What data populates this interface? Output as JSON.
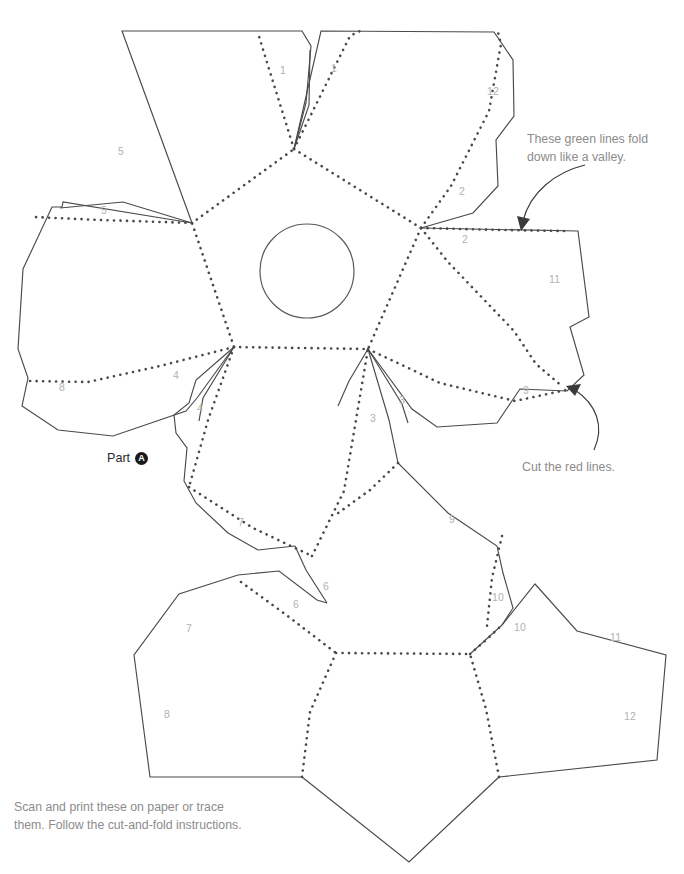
{
  "sheet": {
    "title": "Papercraft Dodecahedron Template",
    "part_label": "Part",
    "part_badge": "A",
    "caption": "Scan and print these on paper or trace\nthem. Follow the cut-and-fold instructions.",
    "background_color": "#ffffff",
    "cut_line_color": "#4a4a4a",
    "fold_line_color": "#4a4a4a",
    "number_color": "#b2b2b2",
    "annotation_color": "#8c8c8c"
  },
  "annotations": [
    {
      "id": "valley",
      "text": "These green lines fold\ndown like a valley."
    },
    {
      "id": "cut",
      "text": "Cut the red lines."
    }
  ],
  "tab_numbers": [
    {
      "label": "1",
      "x": 280,
      "y": 74
    },
    {
      "label": "1",
      "x": 331,
      "y": 72
    },
    {
      "label": "12",
      "x": 487,
      "y": 95
    },
    {
      "label": "5",
      "x": 118,
      "y": 155
    },
    {
      "label": "5",
      "x": 101,
      "y": 214
    },
    {
      "label": "2",
      "x": 459,
      "y": 195
    },
    {
      "label": "2",
      "x": 462,
      "y": 243
    },
    {
      "label": "11",
      "x": 549,
      "y": 283
    },
    {
      "label": "8",
      "x": 59,
      "y": 391
    },
    {
      "label": "4",
      "x": 173,
      "y": 379
    },
    {
      "label": "4",
      "x": 197,
      "y": 412
    },
    {
      "label": "3",
      "x": 399,
      "y": 404
    },
    {
      "label": "3",
      "x": 370,
      "y": 422
    },
    {
      "label": "9",
      "x": 523,
      "y": 394
    },
    {
      "label": "7",
      "x": 238,
      "y": 526
    },
    {
      "label": "9",
      "x": 449,
      "y": 523
    },
    {
      "label": "6",
      "x": 323,
      "y": 590
    },
    {
      "label": "6",
      "x": 293,
      "y": 608
    },
    {
      "label": "10",
      "x": 492,
      "y": 601
    },
    {
      "label": "10",
      "x": 514,
      "y": 631
    },
    {
      "label": "7",
      "x": 186,
      "y": 632
    },
    {
      "label": "11",
      "x": 610,
      "y": 641
    },
    {
      "label": "8",
      "x": 164,
      "y": 718
    },
    {
      "label": "12",
      "x": 624,
      "y": 720
    }
  ],
  "geometry": {
    "center_hole": {
      "cx": 307,
      "cy": 271,
      "r": 47
    },
    "description": "Dodecahedron net, part A: five pentagons with glue tabs arranged around a central pentagon, plus a lower cluster of three pentagons."
  }
}
